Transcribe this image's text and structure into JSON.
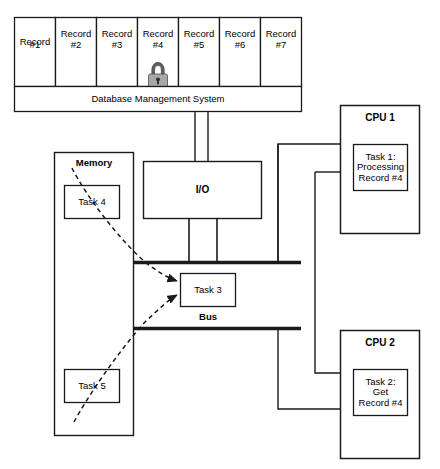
{
  "diagram": {
    "title_hidden": "",
    "records": [
      {
        "line1": "Record",
        "line2": "#1"
      },
      {
        "line1": "Record",
        "line2": "#2"
      },
      {
        "line1": "Record",
        "line2": "#3"
      },
      {
        "line1": "Record",
        "line2": "#4"
      },
      {
        "line1": "Record",
        "line2": "#5"
      },
      {
        "line1": "Record",
        "line2": "#6"
      },
      {
        "line1": "Record",
        "line2": "#7"
      }
    ],
    "locked_record_index": 3,
    "lock_icon": "padlock-icon",
    "dbms": {
      "label": "Database Management System"
    },
    "memory": {
      "label": "Memory",
      "tasks": [
        {
          "label": "Task 4"
        },
        {
          "label": "Task 5"
        }
      ]
    },
    "io": {
      "label": "I/O"
    },
    "bus": {
      "label": "Bus"
    },
    "task3": {
      "label": "Task 3"
    },
    "cpus": [
      {
        "label": "CPU 1",
        "task": "Task 1:\nProcessing\nRecord #4"
      },
      {
        "label": "CPU 2",
        "task": "Task 2:\nGet\nRecord #4"
      }
    ],
    "colors": {
      "stroke": "#1a1a1a",
      "fill": "#ffffff",
      "lock_body": "#a8a8a8",
      "lock_shackle": "#6b6b6b",
      "text": "#000000"
    }
  }
}
